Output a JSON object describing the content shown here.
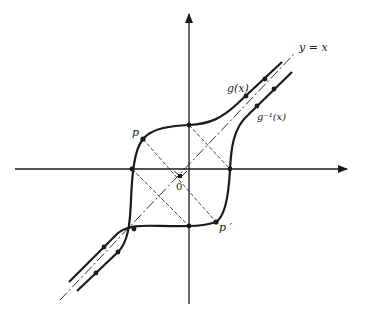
{
  "diagram": {
    "type": "function-inverse-reflection",
    "labels": {
      "line_identity": "y = x",
      "function": "g(x)",
      "inverse": "g⁻¹(x)",
      "point": "p",
      "reflected_point": "p ′",
      "origin": "0"
    },
    "colors": {
      "stroke": "#1a1a1a",
      "background": "#ffffff"
    }
  }
}
